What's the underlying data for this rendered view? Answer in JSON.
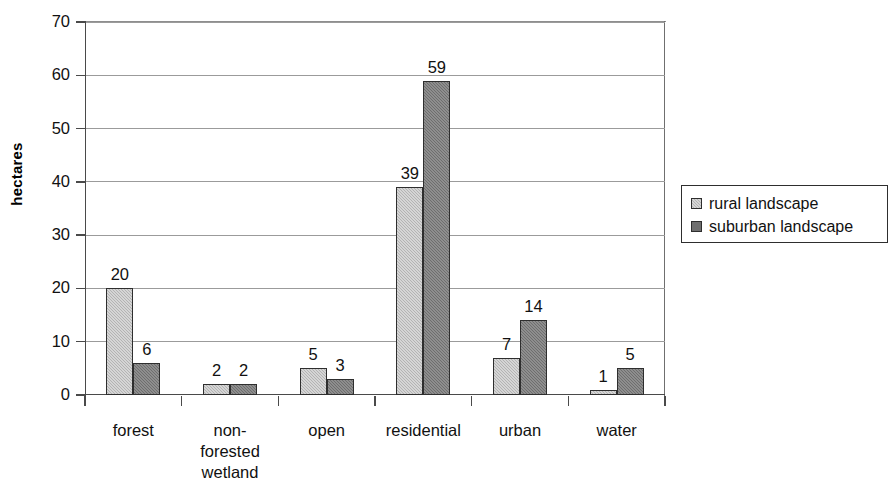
{
  "chart_data": {
    "type": "bar",
    "title": "",
    "xlabel": "",
    "ylabel": "hectares",
    "ylim": [
      0,
      70
    ],
    "ytick_step": 10,
    "grid": true,
    "legend_position": "right",
    "categories": [
      "forest",
      "non-foreste d wetland",
      "open",
      "residential",
      "urban",
      "water"
    ],
    "category_lines": [
      [
        "forest"
      ],
      [
        "non-",
        "forested",
        "wetland"
      ],
      [
        "open"
      ],
      [
        "residential"
      ],
      [
        "urban"
      ],
      [
        "water"
      ]
    ],
    "yticks": [
      "0",
      "10",
      "20",
      "30",
      "40",
      "50",
      "60",
      "70"
    ],
    "series": [
      {
        "name": "rural landscape",
        "color": "#b3b3b3",
        "values": [
          20,
          2,
          5,
          39,
          7,
          1
        ]
      },
      {
        "name": "suburban landscape",
        "color": "#6e6e6e",
        "values": [
          6,
          2,
          3,
          59,
          14,
          5
        ]
      }
    ],
    "data_labels": {
      "rural": [
        "20",
        "2",
        "5",
        "39",
        "7",
        "1"
      ],
      "suburban": [
        "6",
        "2",
        "3",
        "59",
        "14",
        "5"
      ]
    }
  },
  "legend": {
    "items": [
      {
        "label": "rural landscape"
      },
      {
        "label": "suburban landscape"
      }
    ]
  },
  "axis": {
    "y_title": "hectares"
  }
}
